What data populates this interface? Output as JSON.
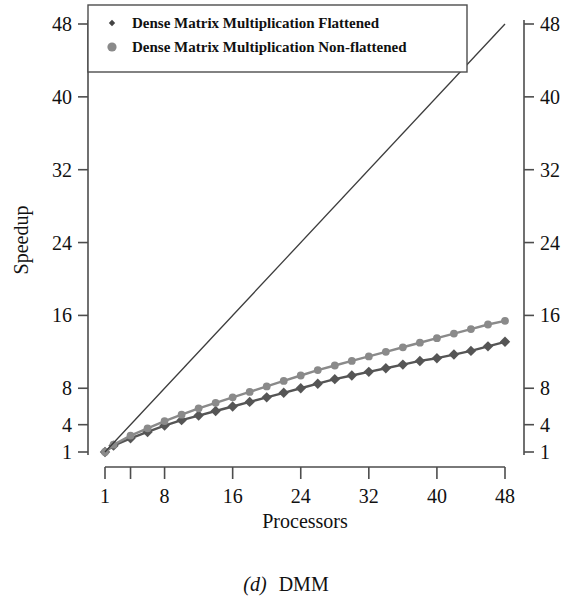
{
  "figure": {
    "caption_prefix": "(d)",
    "caption_text": "DMM"
  },
  "chart_data": {
    "type": "line",
    "title": "",
    "xlabel": "Processors",
    "ylabel": "Speedup",
    "xlim": [
      1,
      48
    ],
    "ylim": [
      1,
      48
    ],
    "xticks": [
      1,
      8,
      16,
      24,
      32,
      40,
      48
    ],
    "xtick_labels": [
      "1",
      "8",
      "16",
      "24",
      "32",
      "40",
      "48"
    ],
    "xticks_minor": [
      4
    ],
    "yticks": [
      1,
      4,
      8,
      16,
      24,
      32,
      40,
      48
    ],
    "ytick_labels": [
      "1",
      "4",
      "8",
      "16",
      "24",
      "32",
      "40",
      "48"
    ],
    "grid": false,
    "legend_position": "top-left",
    "right_axis_mirrored": true,
    "series": [
      {
        "name": "Dense Matrix Multiplication Flattened",
        "marker": "diamond",
        "color": "#555555",
        "legend_marker_size": "small",
        "x": [
          1,
          2,
          4,
          6,
          8,
          10,
          12,
          14,
          16,
          18,
          20,
          22,
          24,
          26,
          28,
          30,
          32,
          34,
          36,
          38,
          40,
          42,
          44,
          46,
          48
        ],
        "values": [
          1.0,
          1.7,
          2.5,
          3.2,
          3.9,
          4.5,
          5.0,
          5.5,
          6.0,
          6.5,
          7.0,
          7.5,
          8.0,
          8.5,
          9.0,
          9.4,
          9.8,
          10.2,
          10.6,
          11.0,
          11.3,
          11.7,
          12.1,
          12.6,
          13.1
        ]
      },
      {
        "name": "Dense Matrix Multiplication Non-flattened",
        "marker": "circle",
        "color": "#8a8a8a",
        "legend_marker_size": "large",
        "x": [
          1,
          2,
          4,
          6,
          8,
          10,
          12,
          14,
          16,
          18,
          20,
          22,
          24,
          26,
          28,
          30,
          32,
          34,
          36,
          38,
          40,
          42,
          44,
          46,
          48
        ],
        "values": [
          1.0,
          1.8,
          2.8,
          3.6,
          4.4,
          5.1,
          5.8,
          6.4,
          7.0,
          7.6,
          8.2,
          8.8,
          9.4,
          10.0,
          10.5,
          11.0,
          11.5,
          12.0,
          12.5,
          13.0,
          13.5,
          14.0,
          14.5,
          15.0,
          15.4
        ]
      },
      {
        "name": "ideal-linear-speedup",
        "marker": "none",
        "color": "#3c3c3c",
        "x": [
          1,
          48
        ],
        "values": [
          1,
          48
        ]
      }
    ],
    "legend_entries": [
      "Dense Matrix Multiplication Flattened",
      "Dense Matrix Multiplication Non-flattened"
    ]
  }
}
